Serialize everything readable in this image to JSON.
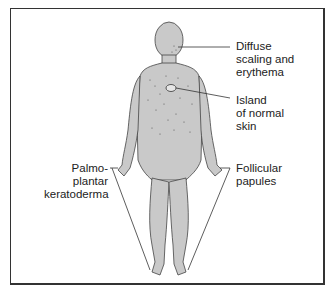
{
  "figure": {
    "fill_color": "#c9c9c9",
    "outline_color": "#444444",
    "labels": {
      "diffuse": [
        "Diffuse",
        "scaling and",
        "erythema"
      ],
      "island": [
        "Island",
        "of normal",
        "skin"
      ],
      "palmo": [
        "Palmo-",
        "plantar",
        "keratoderma"
      ],
      "follicular": [
        "Follicular",
        "papules"
      ]
    }
  }
}
